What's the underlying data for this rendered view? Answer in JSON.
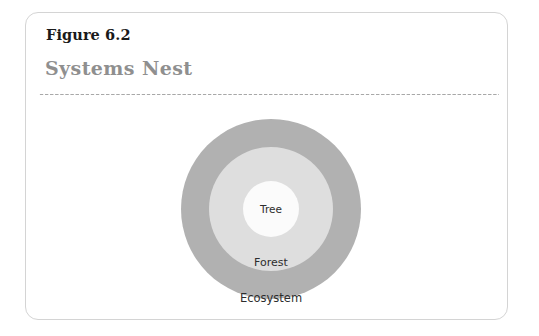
{
  "figure": {
    "number_label": "Figure 6.2",
    "title": "Systems Nest",
    "divider": "dotted-rule"
  },
  "colors": {
    "card_border": "#d4d4d4",
    "card_background": "#ffffff",
    "figure_number_text": "#1a1a1a",
    "title_text": "#8f8f8f",
    "divider_dots": "#a8a8a8",
    "outer_ring": "#b1b1b1",
    "middle_ring": "#dedede",
    "inner_circle": "#fbfbfb",
    "ring_label_text": "#2d2d2d"
  },
  "chart_data": {
    "type": "nested-circles",
    "title": "Systems Nest",
    "subtitle": "Figure 6.2",
    "xlabel": "",
    "ylabel": "",
    "legend_position": "none",
    "grid": false,
    "center": {
      "x": 245,
      "y": 196
    },
    "levels": [
      {
        "rank": 1,
        "label": "Tree",
        "scope": "innermost",
        "radius": 28,
        "fill": "#fbfbfb",
        "label_position": "center"
      },
      {
        "rank": 2,
        "label": "Forest",
        "scope": "middle",
        "radius": 62,
        "fill": "#dedede",
        "label_position": "lower-band"
      },
      {
        "rank": 3,
        "label": "Ecosystem",
        "scope": "outermost",
        "radius": 90,
        "fill": "#b1b1b1",
        "label_position": "lower-band"
      }
    ],
    "categories": [
      "Tree",
      "Forest",
      "Ecosystem"
    ],
    "values": [
      28,
      62,
      90
    ]
  }
}
